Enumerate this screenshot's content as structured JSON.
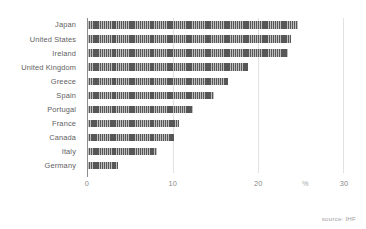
{
  "chart_data": {
    "type": "bar",
    "orientation": "horizontal",
    "title": "",
    "subtitle": "",
    "xlabel": "%",
    "ylabel": "",
    "xlim": [
      0,
      30
    ],
    "xticks": [
      0,
      10,
      20,
      30
    ],
    "xticklabels": [
      "0",
      "10",
      "20",
      "30"
    ],
    "unit_label": "%",
    "unit_label_position": 25.5,
    "grid": true,
    "grid_axis": "x",
    "legend": false,
    "legend_position": "none",
    "bar_color": "#575757",
    "bar_pattern": "vertical-hatch",
    "grid_color": "#e2e2e2",
    "axis_color": "#8d8d8d",
    "label_color": "#5e5e5e",
    "tick_color": "#8a8a8a",
    "categories": [
      "Japan",
      "United States",
      "Ireland",
      "United Kingdom",
      "Greece",
      "Spain",
      "Portugal",
      "France",
      "Canada",
      "Italy",
      "Germany"
    ],
    "values": [
      24.5,
      23.7,
      23.4,
      18.7,
      16.4,
      14.7,
      12.3,
      10.6,
      10.0,
      8.0,
      3.5
    ],
    "annotations": [
      {
        "text": "source: IHF",
        "position": "bottom-right"
      }
    ]
  },
  "source": {
    "text": "source: IHF"
  }
}
